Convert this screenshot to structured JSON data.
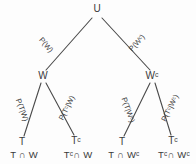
{
  "diagram": {
    "type": "probability-tree",
    "root": {
      "label": "U",
      "x": 97,
      "y": 9
    },
    "level1": [
      {
        "id": "w",
        "label": "W",
        "x": 43,
        "y": 76,
        "edge_label": "P(W)",
        "edge_angle": 49
      },
      {
        "id": "wc",
        "label": "Wᶜ",
        "x": 152,
        "y": 76,
        "edge_label": "P(Wᶜ)",
        "edge_angle": -48
      }
    ],
    "level2": [
      {
        "id": "t-w",
        "label": "T",
        "x": 22,
        "y": 142,
        "edge_label": "P(T|W)",
        "edge_angle": 70
      },
      {
        "id": "tc-w",
        "label": "Tᶜ",
        "x": 76,
        "y": 141,
        "edge_label": "P(Tᶜ|W)",
        "edge_angle": -63
      },
      {
        "id": "t-wc",
        "label": "T",
        "x": 122,
        "y": 142,
        "edge_label": "P(T|Wᶜ)",
        "edge_angle": 70
      },
      {
        "id": "tc-wc",
        "label": "Tᶜ",
        "x": 173,
        "y": 141,
        "edge_label": "P(Tᶜ|Wᶜ)",
        "edge_angle": -63
      }
    ],
    "outcomes": [
      {
        "id": "t-cap-w",
        "label": "T ∩ W",
        "x": 24,
        "y": 155
      },
      {
        "id": "tc-cap-w",
        "label": "Tᶜ∩ W",
        "x": 78,
        "y": 155
      },
      {
        "id": "t-cap-wc",
        "label": "T ∩ Wᶜ",
        "x": 124,
        "y": 155
      },
      {
        "id": "tc-cap-wc",
        "label": "Tᶜ∩ Wᶜ",
        "x": 174,
        "y": 155
      }
    ],
    "edges": [
      {
        "id": "u-w",
        "from": "U",
        "to": "W",
        "x1": 92,
        "y1": 18,
        "x2": 46,
        "y2": 70
      },
      {
        "id": "u-wc",
        "from": "U",
        "to": "Wc",
        "x1": 102,
        "y1": 18,
        "x2": 150,
        "y2": 70
      },
      {
        "id": "w-t",
        "from": "W",
        "to": "T",
        "x1": 41,
        "y1": 83,
        "x2": 24,
        "y2": 136
      },
      {
        "id": "w-tc",
        "from": "W",
        "to": "Tc",
        "x1": 46,
        "y1": 83,
        "x2": 74,
        "y2": 135
      },
      {
        "id": "wc-t",
        "from": "Wc",
        "to": "T",
        "x1": 150,
        "y1": 83,
        "x2": 124,
        "y2": 136
      },
      {
        "id": "wc-tc",
        "from": "Wc",
        "to": "Tc",
        "x1": 155,
        "y1": 83,
        "x2": 171,
        "y2": 135
      }
    ],
    "colors": {
      "background": "#fdfdfd",
      "ink": "#3a3a3a",
      "line": "#4a4a4a"
    }
  }
}
